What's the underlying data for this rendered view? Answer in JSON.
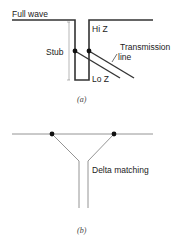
{
  "figure_a": {
    "caption": "(a)",
    "labels": {
      "full_wave": "Full wave",
      "hi_z": "Hi Z",
      "stub": "Stub",
      "transmission": "Transmission",
      "line": "line",
      "lo_z": "Lo Z"
    }
  },
  "figure_b": {
    "caption": "(b)",
    "labels": {
      "delta_matching": "Delta matching"
    }
  },
  "colors": {
    "thick_line": "#333333",
    "thin_line": "#888888",
    "dot": "#111111"
  }
}
